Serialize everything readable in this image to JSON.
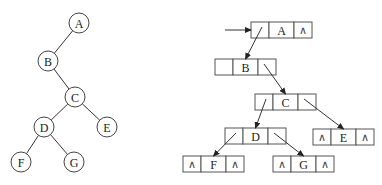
{
  "tree": {
    "nodes": [
      {
        "id": "A",
        "label": "A",
        "cx": 79,
        "cy": 23
      },
      {
        "id": "B",
        "label": "B",
        "cx": 48,
        "cy": 61
      },
      {
        "id": "C",
        "label": "C",
        "cx": 75,
        "cy": 97
      },
      {
        "id": "D",
        "label": "D",
        "cx": 44,
        "cy": 127
      },
      {
        "id": "E",
        "label": "E",
        "cx": 107,
        "cy": 127
      },
      {
        "id": "F",
        "label": "F",
        "cx": 21,
        "cy": 162
      },
      {
        "id": "G",
        "label": "G",
        "cx": 74,
        "cy": 162
      }
    ],
    "edges": [
      [
        "A",
        "B"
      ],
      [
        "B",
        "C"
      ],
      [
        "C",
        "D"
      ],
      [
        "C",
        "E"
      ],
      [
        "D",
        "F"
      ],
      [
        "D",
        "G"
      ]
    ]
  },
  "linked": {
    "null_symbol": "∧",
    "entry_arrow": {
      "x1": 225,
      "y1": 30,
      "x2": 251,
      "y2": 30
    },
    "nodes": [
      {
        "id": "A",
        "label": "A",
        "x": 251,
        "y": 22,
        "left_null": false,
        "right_null": true
      },
      {
        "id": "B",
        "label": "B",
        "x": 215,
        "y": 59,
        "left_null": false,
        "right_null": false
      },
      {
        "id": "C",
        "label": "C",
        "x": 255,
        "y": 94,
        "left_null": false,
        "right_null": false
      },
      {
        "id": "D",
        "label": "D",
        "x": 225,
        "y": 128,
        "left_null": false,
        "right_null": false
      },
      {
        "id": "E",
        "label": "E",
        "x": 313,
        "y": 129,
        "left_null": true,
        "right_null": true
      },
      {
        "id": "F",
        "label": "F",
        "x": 183,
        "y": 156,
        "left_null": true,
        "right_null": true
      },
      {
        "id": "G",
        "label": "G",
        "x": 273,
        "y": 156,
        "left_null": true,
        "right_null": true
      }
    ],
    "pointers": [
      {
        "from": "A",
        "side": "left",
        "to": "B"
      },
      {
        "from": "B",
        "side": "right",
        "to": "C"
      },
      {
        "from": "C",
        "side": "left",
        "to": "D"
      },
      {
        "from": "C",
        "side": "right",
        "to": "E"
      },
      {
        "from": "D",
        "side": "left",
        "to": "F"
      },
      {
        "from": "D",
        "side": "right",
        "to": "G"
      }
    ]
  }
}
